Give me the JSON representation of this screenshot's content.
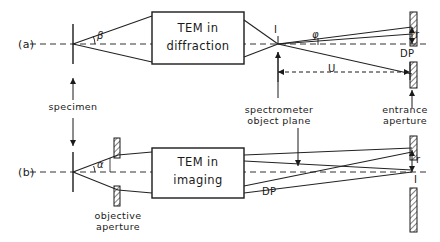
{
  "figure": {
    "panels": [
      {
        "tag": "(a)",
        "mode_line1": "TEM  in",
        "mode_line2": "diffraction",
        "angle_at_specimen": "β",
        "angle_at_aperture": "φ",
        "crossover_label": "I",
        "plane_label": "DP",
        "radius_label": "r",
        "distance_label": "U"
      },
      {
        "tag": "(b)",
        "mode_line1": "TEM  in",
        "mode_line2": "imaging",
        "angle_at_specimen": "α",
        "plane_label": "DP",
        "radius_label": "r",
        "image_label": "I",
        "aperture_line1": "objective",
        "aperture_line2": "aperture"
      }
    ],
    "shared_labels": {
      "specimen": "specimen",
      "spectrometer_line1": "spectrometer",
      "spectrometer_line2": "object  plane",
      "entrance_line1": "entrance",
      "entrance_line2": "aperture"
    },
    "colors": {
      "ink": "#1a1a1a",
      "ray": "#222222",
      "axis": "#333333",
      "background": "#ffffff"
    }
  }
}
